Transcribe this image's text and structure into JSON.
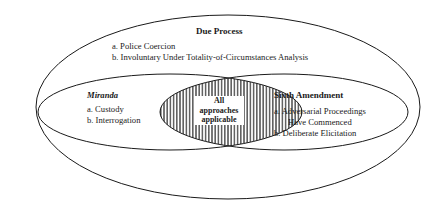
{
  "diagram": {
    "outer": {
      "title": "Due Process",
      "items": [
        "a.  Police Coercion",
        "b.  Involuntary Under Totality-of-Circumstances Analysis"
      ]
    },
    "left": {
      "title": "Miranda",
      "items": [
        "a.  Custody",
        "b.  Interrogation"
      ]
    },
    "right": {
      "title": "Sixth Amendment",
      "items": [
        "a.  Adversarial Proceedings",
        "Have Commenced",
        "b.  Deliberate Elicitation"
      ]
    },
    "intersection": {
      "lines": [
        "All",
        "approaches",
        "applicable"
      ]
    },
    "colors": {
      "stroke": "#1a1a1a",
      "background": "#ffffff"
    }
  }
}
